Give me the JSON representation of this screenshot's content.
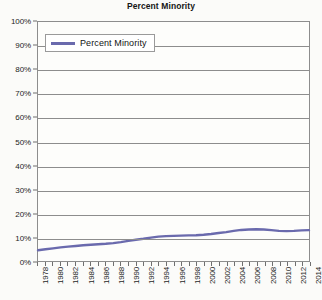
{
  "chart_data": {
    "type": "line",
    "title": "Percent Minority",
    "xlabel": "",
    "ylabel": "",
    "grid": true,
    "legend_position": "top-left-inside",
    "ylim": [
      0,
      100
    ],
    "xlim": [
      1978,
      2014
    ],
    "ytick_labels": [
      "0%",
      "10%",
      "20%",
      "30%",
      "40%",
      "50%",
      "60%",
      "70%",
      "80%",
      "90%",
      "100%"
    ],
    "ytick_values": [
      0,
      10,
      20,
      30,
      40,
      50,
      60,
      70,
      80,
      90,
      100
    ],
    "xtick_labels": [
      "1978",
      "1980",
      "1982",
      "1984",
      "1986",
      "1988",
      "1990",
      "1992",
      "1994",
      "1996",
      "1998",
      "2000",
      "2002",
      "2004",
      "2006",
      "2008",
      "2010",
      "2012",
      "2014"
    ],
    "xtick_values": [
      1978,
      1980,
      1982,
      1984,
      1986,
      1988,
      1990,
      1992,
      1994,
      1996,
      1998,
      2000,
      2002,
      2004,
      2006,
      2008,
      2010,
      2012,
      2014
    ],
    "series": [
      {
        "name": "Percent Minority",
        "color": "#6a6aad",
        "x": [
          1978,
          1979,
          1980,
          1981,
          1982,
          1983,
          1984,
          1985,
          1986,
          1987,
          1988,
          1989,
          1990,
          1991,
          1992,
          1993,
          1994,
          1995,
          1996,
          1997,
          1998,
          1999,
          2000,
          2001,
          2002,
          2003,
          2004,
          2005,
          2006,
          2007,
          2008,
          2009,
          2010,
          2011,
          2012,
          2013,
          2014
        ],
        "values": [
          4.5,
          4.9,
          5.3,
          5.7,
          6.0,
          6.3,
          6.6,
          6.8,
          7.0,
          7.2,
          7.5,
          7.9,
          8.4,
          8.9,
          9.3,
          9.8,
          10.2,
          10.4,
          10.5,
          10.6,
          10.7,
          10.8,
          11.0,
          11.3,
          11.7,
          12.1,
          12.6,
          13.0,
          13.2,
          13.3,
          13.2,
          12.9,
          12.6,
          12.5,
          12.6,
          12.8,
          12.9
        ]
      }
    ]
  },
  "legend": {
    "entries": [
      {
        "label": "Percent Minority",
        "color": "#6a6aad"
      }
    ]
  },
  "colors": {
    "series_line": "#6a6aad",
    "gridline": "#8d8d8d",
    "plot_background": "#fdfdfb",
    "page_background": "#fbfbf9",
    "text": "#1a1a1a"
  }
}
